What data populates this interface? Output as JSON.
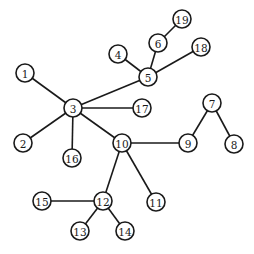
{
  "diagram": {
    "type": "tree-graph",
    "node_radius": 9,
    "colors": {
      "stroke": "#1a1a1a",
      "fill": "#ffffff",
      "text": "#1a1a1a"
    },
    "nodes": [
      {
        "id": "1",
        "label": "1",
        "x": 25,
        "y": 73
      },
      {
        "id": "2",
        "label": "2",
        "x": 23,
        "y": 143
      },
      {
        "id": "3",
        "label": "3",
        "x": 73,
        "y": 108
      },
      {
        "id": "4",
        "label": "4",
        "x": 118,
        "y": 54
      },
      {
        "id": "5",
        "label": "5",
        "x": 148,
        "y": 77
      },
      {
        "id": "6",
        "label": "6",
        "x": 158,
        "y": 43
      },
      {
        "id": "7",
        "label": "7",
        "x": 212,
        "y": 103
      },
      {
        "id": "8",
        "label": "8",
        "x": 234,
        "y": 144
      },
      {
        "id": "9",
        "label": "9",
        "x": 188,
        "y": 143
      },
      {
        "id": "10",
        "label": "10",
        "x": 122,
        "y": 143
      },
      {
        "id": "11",
        "label": "11",
        "x": 156,
        "y": 202
      },
      {
        "id": "12",
        "label": "12",
        "x": 103,
        "y": 201
      },
      {
        "id": "13",
        "label": "13",
        "x": 80,
        "y": 231
      },
      {
        "id": "14",
        "label": "14",
        "x": 125,
        "y": 231
      },
      {
        "id": "15",
        "label": "15",
        "x": 42,
        "y": 201
      },
      {
        "id": "16",
        "label": "16",
        "x": 72,
        "y": 158
      },
      {
        "id": "17",
        "label": "17",
        "x": 142,
        "y": 108
      },
      {
        "id": "18",
        "label": "18",
        "x": 201,
        "y": 47
      },
      {
        "id": "19",
        "label": "19",
        "x": 182,
        "y": 19
      }
    ],
    "edges": [
      [
        "1",
        "3"
      ],
      [
        "2",
        "3"
      ],
      [
        "16",
        "3"
      ],
      [
        "17",
        "3"
      ],
      [
        "5",
        "3"
      ],
      [
        "10",
        "3"
      ],
      [
        "4",
        "5"
      ],
      [
        "6",
        "5"
      ],
      [
        "18",
        "5"
      ],
      [
        "19",
        "6"
      ],
      [
        "10",
        "9"
      ],
      [
        "10",
        "11"
      ],
      [
        "10",
        "12"
      ],
      [
        "9",
        "7"
      ],
      [
        "7",
        "8"
      ],
      [
        "12",
        "15"
      ],
      [
        "12",
        "13"
      ],
      [
        "12",
        "14"
      ]
    ]
  }
}
